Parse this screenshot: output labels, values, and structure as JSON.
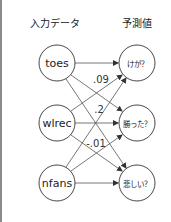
{
  "headers": {
    "input": "入力データ",
    "output": "予測値"
  },
  "inputs": [
    {
      "label": "toes"
    },
    {
      "label": "wlrec"
    },
    {
      "label": "nfans"
    }
  ],
  "outputs": [
    {
      "label": "けが？"
    },
    {
      "label": "勝った？"
    },
    {
      "label": "悲しい？"
    }
  ],
  "weights": [
    {
      "label": ".09"
    },
    {
      "label": ".2"
    },
    {
      "label": "-.01"
    }
  ],
  "colors": {
    "stroke": "#333333",
    "edge": "#555555",
    "border": "#8a8a8a"
  }
}
